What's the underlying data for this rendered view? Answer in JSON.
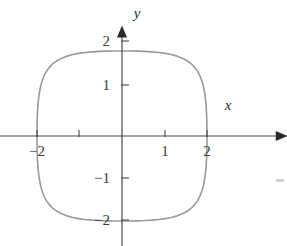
{
  "figure": {
    "name": "superellipse-graph",
    "background_color": "#ffffff",
    "axis_color": "#4a4a4a",
    "curve_color": "#9a9a9a",
    "label_color": "#3a3a3a"
  },
  "axes": {
    "x_label": "x",
    "y_label": "y",
    "origin_px": {
      "x": 122,
      "y": 136
    },
    "unit_px": 42.5,
    "x_axis_y_px": 136,
    "y_axis_x_px": 122
  },
  "ticks": {
    "x": [
      {
        "value": -2,
        "label": "−2",
        "px": 37,
        "labeled": true
      },
      {
        "value": -1,
        "label": "",
        "px": 79,
        "labeled": false
      },
      {
        "value": 1,
        "label": "1",
        "px": 165,
        "labeled": true
      },
      {
        "value": 2,
        "label": "2",
        "px": 207,
        "labeled": true
      }
    ],
    "y": [
      {
        "value": 2,
        "label": "2",
        "px": 41,
        "labeled": true
      },
      {
        "value": 1,
        "label": "1",
        "px": 85,
        "labeled": true
      },
      {
        "value": -1,
        "label": "−1",
        "px": 178,
        "labeled": true
      },
      {
        "value": -2,
        "label": "−2",
        "px": 220,
        "labeled": true
      }
    ]
  },
  "chart_data": {
    "type": "line",
    "title": "",
    "xlabel": "x",
    "ylabel": "y",
    "xlim": [
      -2.9,
      3.9
    ],
    "ylim": [
      -2.6,
      2.6
    ],
    "grid": false,
    "legend": null,
    "annotations": [],
    "series": [
      {
        "name": "superellipse",
        "equation": "x^4 + y^4 = 2^4",
        "closed": true,
        "color": "#9a9a9a",
        "x_intercepts": [
          -2,
          2
        ],
        "y_intercepts": [
          -2,
          2
        ],
        "x": [
          2.0,
          1.999,
          1.996,
          1.99,
          1.98,
          1.965,
          1.944,
          1.916,
          1.879,
          1.832,
          1.775,
          1.705,
          1.622,
          1.527,
          1.418,
          1.296,
          1.162,
          1.018,
          0.864,
          0.701,
          0.531,
          0.356,
          0.178,
          0.0,
          -0.178,
          -0.356,
          -0.531,
          -0.701,
          -0.864,
          -1.018,
          -1.162,
          -1.296,
          -1.418,
          -1.527,
          -1.622,
          -1.705,
          -1.775,
          -1.832,
          -1.879,
          -1.916,
          -1.944,
          -1.965,
          -1.98,
          -1.99,
          -1.996,
          -1.999,
          -2.0,
          -1.999,
          -1.996,
          -1.99,
          -1.98,
          -1.965,
          -1.944,
          -1.916,
          -1.879,
          -1.832,
          -1.775,
          -1.705,
          -1.622,
          -1.527,
          -1.418,
          -1.296,
          -1.162,
          -1.018,
          -0.864,
          -0.701,
          -0.531,
          -0.356,
          -0.178,
          0.0,
          0.178,
          0.356,
          0.531,
          0.701,
          0.864,
          1.018,
          1.162,
          1.296,
          1.418,
          1.527,
          1.622,
          1.705,
          1.775,
          1.832,
          1.879,
          1.916,
          1.944,
          1.965,
          1.98,
          1.99,
          1.996,
          1.999,
          2.0
        ],
        "y": [
          0.0,
          0.178,
          0.356,
          0.531,
          0.701,
          0.864,
          1.018,
          1.162,
          1.296,
          1.418,
          1.527,
          1.622,
          1.705,
          1.775,
          1.832,
          1.879,
          1.916,
          1.944,
          1.965,
          1.98,
          1.99,
          1.996,
          1.999,
          2.0,
          1.999,
          1.996,
          1.99,
          1.98,
          1.965,
          1.944,
          1.916,
          1.879,
          1.832,
          1.775,
          1.705,
          1.622,
          1.527,
          1.418,
          1.296,
          1.162,
          1.018,
          0.864,
          0.701,
          0.531,
          0.356,
          0.178,
          0.0,
          -0.178,
          -0.356,
          -0.531,
          -0.701,
          -0.864,
          -1.018,
          -1.162,
          -1.296,
          -1.418,
          -1.527,
          -1.622,
          -1.705,
          -1.775,
          -1.832,
          -1.879,
          -1.916,
          -1.944,
          -1.965,
          -1.98,
          -1.99,
          -1.996,
          -1.999,
          -2.0,
          -1.999,
          -1.996,
          -1.99,
          -1.98,
          -1.965,
          -1.944,
          -1.916,
          -1.879,
          -1.832,
          -1.775,
          -1.705,
          -1.622,
          -1.527,
          -1.418,
          -1.296,
          -1.162,
          -1.018,
          -0.864,
          -0.701,
          -0.531,
          -0.356,
          -0.178,
          0.0
        ]
      }
    ]
  }
}
